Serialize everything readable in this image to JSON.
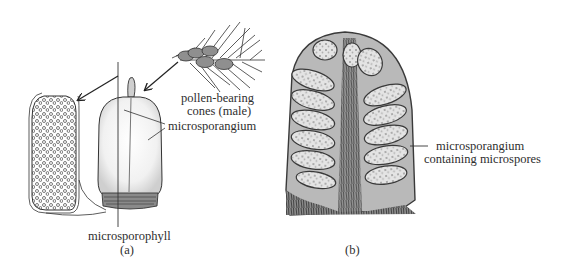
{
  "figure": {
    "panel_a": {
      "caption": "(a)",
      "labels": {
        "pollen_cones_line1": "pollen-bearing",
        "pollen_cones_line2": "cones (male)",
        "microsporangium": "microsporangium",
        "microsporophyll": "microsporophyll"
      }
    },
    "panel_b": {
      "caption": "(b)",
      "labels": {
        "line1": "microsporangium",
        "line2": "containing microspores"
      }
    },
    "colors": {
      "ink": "#2e2e2e",
      "background": "#ffffff",
      "micrograph_dark": "#3a3a3a",
      "micrograph_light": "#d9d9d9"
    }
  }
}
